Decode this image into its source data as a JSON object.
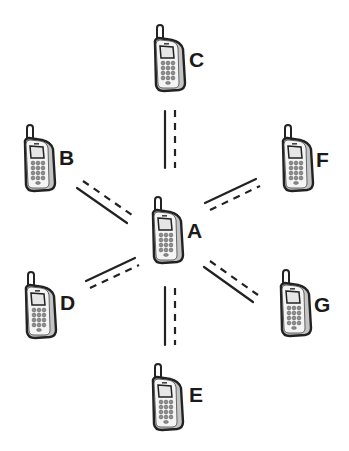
{
  "diagram": {
    "title": "",
    "type": "star-network",
    "center_node": "A",
    "nodes": [
      {
        "id": "A",
        "label": "A",
        "icon": "mobile-phone-icon",
        "x": 150,
        "y": 197,
        "label_x": 187,
        "label_y": 238
      },
      {
        "id": "B",
        "label": "B",
        "icon": "mobile-phone-icon",
        "x": 22,
        "y": 125,
        "label_x": 59,
        "label_y": 165
      },
      {
        "id": "C",
        "label": "C",
        "icon": "mobile-phone-icon",
        "x": 152,
        "y": 25,
        "label_x": 189,
        "label_y": 67
      },
      {
        "id": "D",
        "label": "D",
        "icon": "mobile-phone-icon",
        "x": 23,
        "y": 272,
        "label_x": 60,
        "label_y": 310
      },
      {
        "id": "E",
        "label": "E",
        "icon": "mobile-phone-icon",
        "x": 150,
        "y": 364,
        "label_x": 189,
        "label_y": 402
      },
      {
        "id": "F",
        "label": "F",
        "icon": "mobile-phone-icon",
        "x": 280,
        "y": 125,
        "label_x": 316,
        "label_y": 167
      },
      {
        "id": "G",
        "label": "G",
        "icon": "mobile-phone-icon",
        "x": 278,
        "y": 270,
        "label_x": 314,
        "label_y": 312
      }
    ],
    "links": [
      {
        "from": "A",
        "to": "C",
        "solid": [
          165,
          111,
          165,
          168
        ],
        "dashed": [
          175,
          110,
          175,
          168
        ]
      },
      {
        "from": "A",
        "to": "B",
        "solid": [
          77,
          188,
          127,
          223
        ],
        "dashed": [
          83,
          181,
          132,
          215
        ]
      },
      {
        "from": "A",
        "to": "F",
        "solid": [
          205,
          203,
          256,
          179
        ],
        "dashed": [
          210,
          210,
          260,
          186
        ]
      },
      {
        "from": "A",
        "to": "D",
        "solid": [
          86,
          281,
          135,
          258
        ],
        "dashed": [
          90,
          288,
          139,
          265
        ]
      },
      {
        "from": "A",
        "to": "G",
        "solid": [
          204,
          267,
          253,
          302
        ],
        "dashed": [
          210,
          261,
          258,
          295
        ]
      },
      {
        "from": "A",
        "to": "E",
        "solid": [
          165,
          287,
          165,
          345
        ],
        "dashed": [
          175,
          288,
          175,
          345
        ]
      }
    ],
    "colors": {
      "stroke": "#222222",
      "phone_fill": "#ffffff",
      "phone_shade": "#bdbdbd",
      "keypad": "#9a9a9a",
      "background": "#ffffff"
    }
  }
}
